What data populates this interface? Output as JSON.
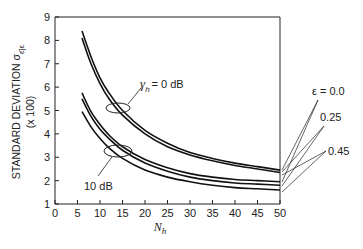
{
  "chart_data": {
    "type": "line",
    "title": "",
    "xlabel": "N_h",
    "xlabel_main": "N",
    "xlabel_sub": "h",
    "ylabel": "STANDARD DEVIATION σ ε̂|ε",
    "ylabel_main": "STANDARD DEVIATION σ",
    "ylabel_sub": "ε̂|ε",
    "ylabel_scale": "(x 100)",
    "xlim": [
      0,
      50
    ],
    "ylim": [
      1,
      9
    ],
    "x_ticks": [
      0,
      5,
      10,
      15,
      20,
      25,
      30,
      35,
      40,
      45,
      50
    ],
    "x_tick_labels": [
      "0",
      "5",
      "10",
      "15",
      "20",
      "25",
      "30",
      "35",
      "40",
      "45",
      "50"
    ],
    "y_ticks": [
      1,
      2,
      3,
      4,
      5,
      6,
      7,
      8,
      9
    ],
    "y_tick_labels": [
      "1",
      "2",
      "3",
      "4",
      "5",
      "6",
      "7",
      "8",
      "9"
    ],
    "grid": false,
    "annotations": {
      "group_0db": "γ_h = 0 dB",
      "group_0db_symbol": "γ",
      "group_0db_sub": "h",
      "group_0db_text": "= 0 dB",
      "group_10db": "10 dB",
      "eps_title": "ε = 0.0",
      "eps_025": "0.25",
      "eps_045": "0.45"
    },
    "x": [
      6,
      8,
      10,
      12,
      15,
      20,
      25,
      30,
      35,
      40,
      45,
      50
    ],
    "series": [
      {
        "name": "0 dB, ε = 0.0",
        "group": "0 dB",
        "epsilon": 0.0,
        "values": [
          8.4,
          7.3,
          6.4,
          5.75,
          5.0,
          4.15,
          3.6,
          3.2,
          2.95,
          2.75,
          2.6,
          2.45
        ]
      },
      {
        "name": "0 dB, ε = 0.25",
        "group": "0 dB",
        "epsilon": 0.25,
        "values": [
          8.1,
          7.0,
          6.15,
          5.5,
          4.8,
          4.0,
          3.45,
          3.1,
          2.85,
          2.65,
          2.5,
          2.35
        ]
      },
      {
        "name": "10 dB, ε = 0.0",
        "group": "10 dB",
        "epsilon": 0.0,
        "values": [
          5.75,
          4.95,
          4.4,
          3.95,
          3.45,
          2.9,
          2.55,
          2.3,
          2.15,
          2.05,
          2.0,
          1.95
        ]
      },
      {
        "name": "10 dB, ε = 0.25",
        "group": "10 dB",
        "epsilon": 0.25,
        "values": [
          5.5,
          4.75,
          4.2,
          3.8,
          3.3,
          2.75,
          2.4,
          2.15,
          2.0,
          1.9,
          1.85,
          1.8
        ]
      },
      {
        "name": "10 dB, ε = 0.45",
        "group": "10 dB",
        "epsilon": 0.45,
        "values": [
          4.95,
          4.3,
          3.8,
          3.4,
          2.95,
          2.45,
          2.15,
          1.95,
          1.8,
          1.7,
          1.65,
          1.6
        ]
      }
    ]
  }
}
